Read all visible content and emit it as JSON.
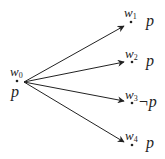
{
  "diagram": {
    "type": "kripke-model",
    "colors": {
      "ink": "#222222",
      "background": "#ffffff"
    },
    "source_world": {
      "id": "w0",
      "name": "w",
      "index": "0",
      "valuation": "p",
      "dot": [
        17,
        81
      ]
    },
    "worlds": [
      {
        "id": "w1",
        "name": "w",
        "index": "1",
        "valuation": "p",
        "dot": [
          131,
          22
        ]
      },
      {
        "id": "w2",
        "name": "w",
        "index": "2",
        "valuation": "p",
        "dot": [
          132,
          62
        ]
      },
      {
        "id": "w3",
        "name": "w",
        "index": "3",
        "valuation": "¬p",
        "dot": [
          132,
          103
        ]
      },
      {
        "id": "w4",
        "name": "w",
        "index": "4",
        "valuation": "p",
        "dot": [
          132,
          145
        ]
      }
    ],
    "edges": [
      {
        "from": "w0",
        "to": "w1"
      },
      {
        "from": "w0",
        "to": "w2"
      },
      {
        "from": "w0",
        "to": "w3"
      },
      {
        "from": "w0",
        "to": "w4"
      }
    ]
  }
}
